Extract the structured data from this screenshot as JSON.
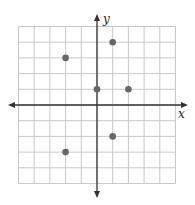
{
  "chart_data": {
    "type": "scatter",
    "title": "",
    "xlabel": "x",
    "ylabel": "y",
    "xlim": [
      -5,
      5
    ],
    "ylim": [
      -5,
      5
    ],
    "grid": true,
    "tick_labels": false,
    "series": [
      {
        "name": "points",
        "points": [
          {
            "x": -2,
            "y": 3
          },
          {
            "x": 1,
            "y": 4
          },
          {
            "x": 0,
            "y": 1
          },
          {
            "x": 2,
            "y": 1
          },
          {
            "x": 1,
            "y": -2
          },
          {
            "x": -2,
            "y": -3
          }
        ]
      }
    ]
  },
  "style": {
    "grid_color": "#c8c8c8",
    "axis_color": "#333333",
    "point_color": "#666666"
  }
}
